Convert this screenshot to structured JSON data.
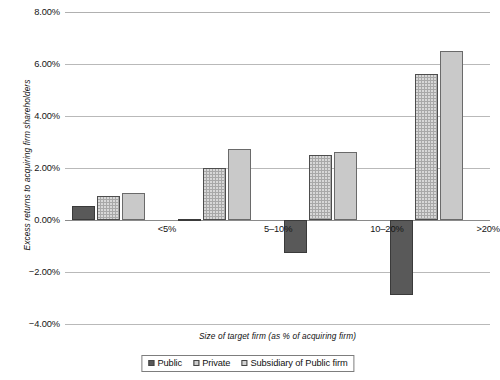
{
  "chart_data": {
    "type": "bar",
    "title": "",
    "xlabel": "Size of target firm (as % of acquiring firm)",
    "ylabel": "Excess returns to acquiring firm shareholders",
    "categories": [
      "<5%",
      "5–10%",
      "10–20%",
      ">20%"
    ],
    "series": [
      {
        "name": "Public",
        "values": [
          0.55,
          0.05,
          -1.27,
          -2.88
        ]
      },
      {
        "name": "Private",
        "values": [
          0.92,
          2.0,
          2.5,
          5.62
        ]
      },
      {
        "name": "Subsidiary of Public firm",
        "values": [
          1.05,
          2.74,
          2.62,
          6.5
        ]
      }
    ],
    "ylim": [
      -4.0,
      8.0
    ],
    "ytick_values": [
      8.0,
      6.0,
      4.0,
      2.0,
      0.0,
      -2.0,
      -4.0
    ],
    "ytick_labels": [
      "8.00%",
      "6.00%",
      "4.00%",
      "2.00%",
      "0.00%",
      "−2.00%",
      "−4.00%"
    ],
    "grid": true,
    "legend_position": "bottom",
    "colors": {
      "public": "#595959",
      "private": "#a8a8a8",
      "subsidiary": "#c9c9c9",
      "gridline": "#b9b9b9",
      "axis": "#8a8a8a",
      "background": "#ffffff"
    }
  },
  "legend": {
    "items": [
      {
        "label": "Public",
        "key": "public"
      },
      {
        "label": "Private",
        "key": "private"
      },
      {
        "label": "Subsidiary of Public firm",
        "key": "subsidiary"
      }
    ]
  }
}
